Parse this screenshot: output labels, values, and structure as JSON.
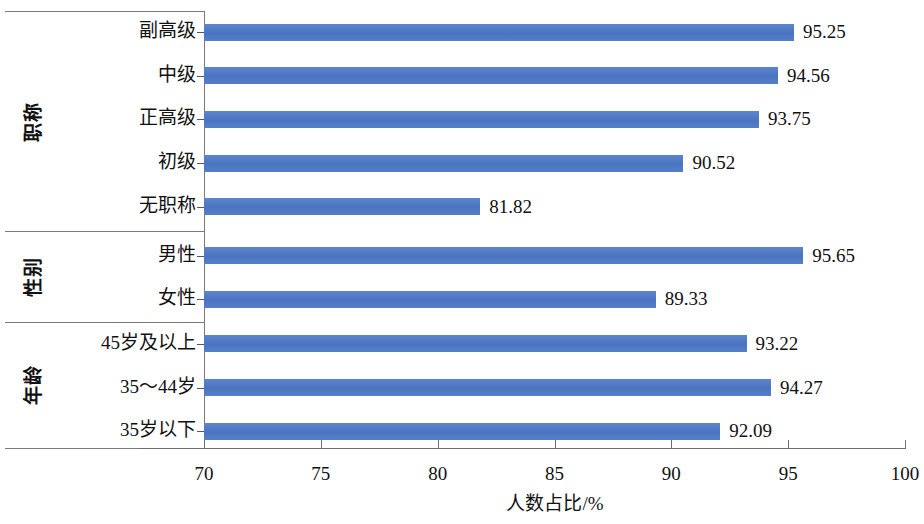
{
  "chart_data": {
    "type": "bar",
    "orientation": "horizontal",
    "title": "",
    "xlabel": "人数占比/%",
    "ylabel": "",
    "xlim": [
      70,
      100
    ],
    "xticks": [
      70,
      75,
      80,
      85,
      90,
      95,
      100
    ],
    "xtick_labels": [
      "70",
      "75",
      "80",
      "85",
      "90",
      "95",
      "100"
    ],
    "grid": false,
    "legend": false,
    "bar_color": "#4e7ac7",
    "groups": [
      {
        "name": "职称",
        "categories": [
          "副高级",
          "中级",
          "正高级",
          "初级",
          "无职称"
        ],
        "values": [
          95.25,
          94.56,
          93.75,
          90.52,
          81.82
        ],
        "value_labels": [
          "95.25",
          "94.56",
          "93.75",
          "90.52",
          "81.82"
        ]
      },
      {
        "name": "性别",
        "categories": [
          "男性",
          "女性"
        ],
        "values": [
          95.65,
          89.33
        ],
        "value_labels": [
          "95.65",
          "89.33"
        ]
      },
      {
        "name": "年龄",
        "categories": [
          "45岁及以上",
          "35～44岁",
          "35岁以下"
        ],
        "values": [
          93.22,
          94.27,
          92.09
        ],
        "value_labels": [
          "93.22",
          "94.27",
          "92.09"
        ]
      }
    ]
  }
}
